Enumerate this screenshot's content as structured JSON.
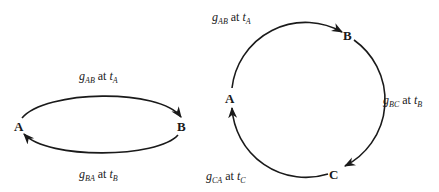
{
  "left_diagram": {
    "nodes": [
      {
        "id": "A",
        "label": "A"
      },
      {
        "id": "B",
        "label": "B"
      }
    ],
    "edges": [
      {
        "from": "A",
        "to": "B",
        "g": "g",
        "g_sub": "AB",
        "at": "at",
        "t": "t",
        "t_sub": "A"
      },
      {
        "from": "B",
        "to": "A",
        "g": "g",
        "g_sub": "BA",
        "at": "at",
        "t": "t",
        "t_sub": "B"
      }
    ]
  },
  "right_diagram": {
    "nodes": [
      {
        "id": "A",
        "label": "A"
      },
      {
        "id": "B",
        "label": "B"
      },
      {
        "id": "C",
        "label": "C"
      }
    ],
    "edges": [
      {
        "from": "A",
        "to": "B",
        "g": "g",
        "g_sub": "AB",
        "at": "at",
        "t": "t",
        "t_sub": "A"
      },
      {
        "from": "B",
        "to": "C",
        "g": "g",
        "g_sub": "BC",
        "at": "at",
        "t": "t",
        "t_sub": "B"
      },
      {
        "from": "C",
        "to": "A",
        "g": "g",
        "g_sub": "CA",
        "at": "at",
        "t": "t",
        "t_sub": "C"
      }
    ]
  },
  "colors": {
    "stroke": "#1a1a1a",
    "background": "#ffffff"
  }
}
